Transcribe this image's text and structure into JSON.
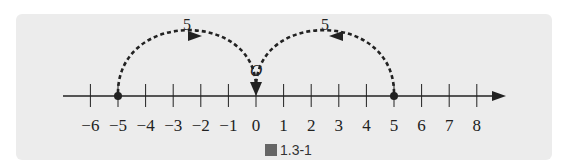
{
  "figure": {
    "caption_prefix": "圖",
    "caption_number": "1.3-1",
    "origin_label": "O",
    "axis": {
      "min": -6,
      "max": 8,
      "tick_labels": [
        "−6",
        "−5",
        "−4",
        "−3",
        "−2",
        "−1",
        "0",
        "1",
        "2",
        "3",
        "4",
        "5",
        "6",
        "7",
        "8"
      ]
    },
    "points": [
      -5,
      5
    ],
    "jumps": [
      {
        "from": -5,
        "to": 0,
        "label": "5",
        "direction": "right"
      },
      {
        "from": 5,
        "to": 0,
        "label": "5",
        "direction": "left"
      }
    ],
    "colors": {
      "panel": "#ececec",
      "ink": "#222222"
    }
  }
}
